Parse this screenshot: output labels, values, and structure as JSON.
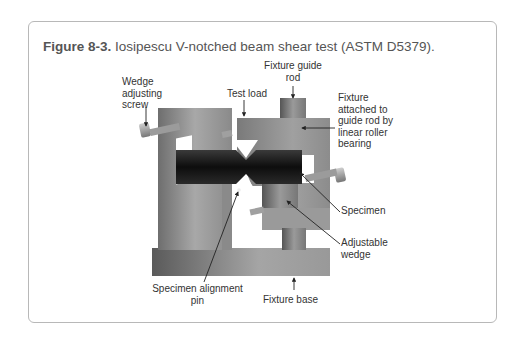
{
  "figure": {
    "number_label": "Figure 8-3.",
    "title": "Iosipescu V-notched beam shear test (ASTM D5379)."
  },
  "labels": {
    "fixture_guide_rod": [
      "Fixture guide",
      "rod"
    ],
    "wedge_adjusting_screw": [
      "Wedge",
      "adjusting",
      "screw"
    ],
    "test_load": "Test load",
    "fixture_attached": [
      "Fixture",
      "attached to",
      "guide rod by",
      "linear roller",
      "bearing"
    ],
    "specimen": "Specimen",
    "adjustable_wedge": [
      "Adjustable",
      "wedge"
    ],
    "specimen_alignment_pin": [
      "Specimen alignment",
      "pin"
    ],
    "fixture_base": "Fixture base"
  },
  "colors": {
    "frame_border": "#b8b8b8",
    "caption_text": "#555555",
    "label_text": "#333333",
    "metal_light": "#b0b0b0",
    "metal_dark": "#6a6a6a",
    "specimen_dark": "#1a1a1a"
  }
}
